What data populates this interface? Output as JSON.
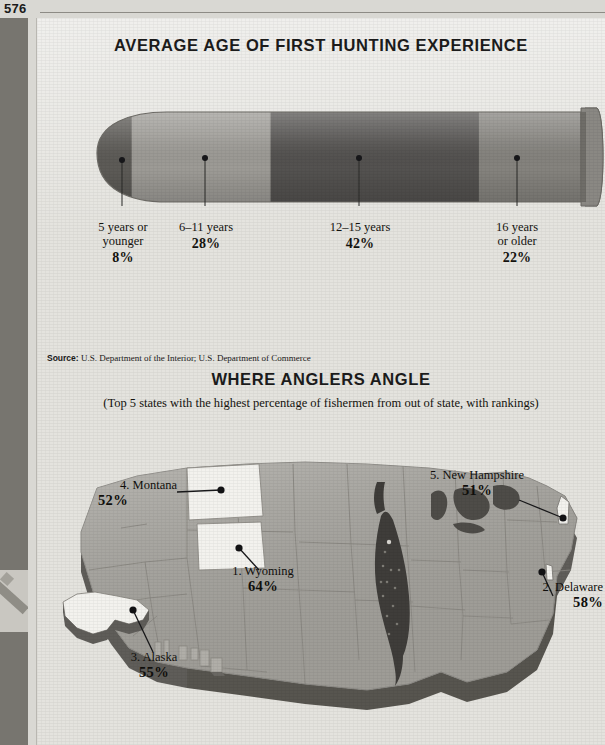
{
  "page": {
    "folio": "576"
  },
  "chart1": {
    "title": "AVERAGE AGE OF FIRST HUNTING EXPERIENCE",
    "source_label": "Source:",
    "source_text": "U.S. Department of the Interior; U.S. Department of Commerce"
  },
  "chart2": {
    "title": "WHERE ANGLERS ANGLE",
    "subtitle": "(Top 5 states with the highest percentage of fishermen from out of state, with rankings)",
    "labels": [
      {
        "name": "4. Montana",
        "pct": "52%"
      },
      {
        "name": "1. Wyoming",
        "pct": "64%"
      },
      {
        "name": "5. New Hampshire",
        "pct": "51%"
      },
      {
        "name": "2. Delaware",
        "pct": "58%"
      },
      {
        "name": "3. Alaska",
        "pct": "55%"
      }
    ]
  },
  "chart_data": [
    {
      "type": "bar",
      "title": "AVERAGE AGE OF FIRST HUNTING EXPERIENCE",
      "subtitle": "",
      "xlabel": "",
      "ylabel": "",
      "orientation": "horizontal-stacked",
      "shape": "bullet-cartridge",
      "categories": [
        "5 years or younger",
        "6–11 years",
        "12–15 years",
        "16 years or older"
      ],
      "values": [
        8,
        28,
        42,
        22
      ],
      "value_labels": [
        "8%",
        "28%",
        "42%",
        "22%"
      ],
      "units": "percent",
      "colors": [
        "#5d5b57",
        "#9d9b96",
        "#545250",
        "#85837e"
      ],
      "legend": "none",
      "grid": false,
      "source": "Source: U.S. Department of the Interior; U.S. Department of Commerce"
    },
    {
      "type": "map",
      "title": "WHERE ANGLERS ANGLE",
      "subtitle": "(Top 5 states with the highest percentage of fishermen from out of state, with rankings)",
      "region": "United States",
      "categories": [
        "Wyoming",
        "Delaware",
        "Alaska",
        "Montana",
        "New Hampshire"
      ],
      "values": [
        64,
        58,
        55,
        52,
        51
      ],
      "value_labels": [
        "64%",
        "58%",
        "55%",
        "52%",
        "51%"
      ],
      "ranks": [
        1,
        2,
        3,
        4,
        5
      ],
      "units": "percent",
      "highlight_color": "#f3f2ee",
      "base_color": "#a8a6a0",
      "grid": false,
      "legend": "none"
    }
  ],
  "bullet": {
    "segments": [
      {
        "id": "seg-1",
        "label_line1": "5 years or",
        "label_line2": "younger",
        "pct": "8%",
        "color": "#5d5b57"
      },
      {
        "id": "seg-2",
        "label_line1": "6–11 years",
        "label_line2": "",
        "pct": "28%",
        "color": "#9d9b96"
      },
      {
        "id": "seg-3",
        "label_line1": "12–15 years",
        "label_line2": "",
        "pct": "42%",
        "color": "#545250"
      },
      {
        "id": "seg-4",
        "label_line1": "16 years",
        "label_line2": "or older",
        "pct": "22%",
        "color": "#85837e"
      }
    ]
  }
}
